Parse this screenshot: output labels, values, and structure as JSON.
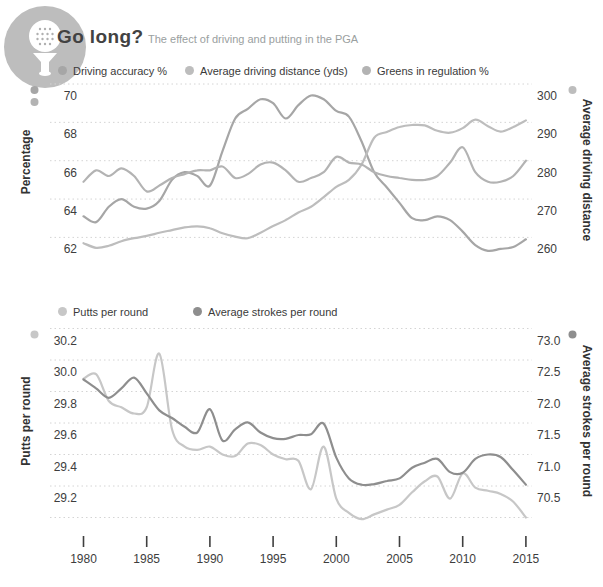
{
  "header": {
    "title": "Go long?",
    "subtitle": "The effect of driving and putting in the PGA",
    "icon": "golf-ball-on-tee"
  },
  "colors": {
    "grid": "#d4d4d4",
    "tick_text": "#3d3d3d",
    "axis_title_text": "#333333",
    "title_text": "#424242",
    "subtitle_text": "#9aa0a0",
    "icon_bg": "#bdbdbd",
    "legend_text": "#3a3a3a"
  },
  "chart_data": [
    {
      "type": "line",
      "x": [
        1980,
        1981,
        1982,
        1983,
        1984,
        1985,
        1986,
        1987,
        1988,
        1989,
        1990,
        1991,
        1992,
        1993,
        1994,
        1995,
        1996,
        1997,
        1998,
        1999,
        2000,
        2001,
        2002,
        2003,
        2004,
        2005,
        2006,
        2007,
        2008,
        2009,
        2010,
        2011,
        2012,
        2013,
        2014,
        2015
      ],
      "axes": {
        "left": {
          "title": "Percentage",
          "tick_labels": [
            "70",
            "68",
            "66",
            "64",
            "62"
          ],
          "range": [
            70,
            62
          ]
        },
        "right": {
          "title": "Average driving distance",
          "tick_labels": [
            "300",
            "290",
            "280",
            "270",
            "260"
          ],
          "range": [
            300,
            260
          ]
        },
        "x": {
          "tick_values": [
            1980,
            1985,
            1990,
            1995,
            2000,
            2005,
            2010,
            2015
          ],
          "labels_shown": false
        }
      },
      "grid": "dotted",
      "legend_position": "top",
      "series": [
        {
          "name": "Driving accuracy %",
          "axis": "left",
          "color": "#a6a6a6",
          "values": [
            63.1,
            62.8,
            63.6,
            64.0,
            63.6,
            63.5,
            63.9,
            65.0,
            65.4,
            65.2,
            64.7,
            66.5,
            68.2,
            68.7,
            69.2,
            69.0,
            68.2,
            68.9,
            69.4,
            69.2,
            68.6,
            68.3,
            67.0,
            65.4,
            64.6,
            63.8,
            63.0,
            62.9,
            63.1,
            62.9,
            62.3,
            61.6,
            61.3,
            61.4,
            61.5,
            61.9
          ]
        },
        {
          "name": "Average driving distance (yds)",
          "axis": "right",
          "color": "#bdbdbd",
          "values": [
            258.5,
            257.3,
            257.8,
            259.0,
            259.8,
            260.4,
            261.2,
            261.9,
            262.6,
            262.9,
            262.4,
            261.1,
            260.2,
            259.8,
            261.2,
            263.0,
            264.5,
            266.5,
            268.0,
            270.5,
            273.2,
            275.0,
            279.0,
            286.0,
            287.5,
            288.8,
            289.3,
            289.2,
            287.8,
            287.3,
            288.5,
            290.7,
            289.0,
            287.6,
            288.8,
            290.5
          ]
        },
        {
          "name": "Greens in regulation %",
          "axis": "left",
          "color": "#b3b3b3",
          "values": [
            64.9,
            65.5,
            65.2,
            65.6,
            65.2,
            64.4,
            64.7,
            65.1,
            65.3,
            65.5,
            65.5,
            65.7,
            65.1,
            65.3,
            65.8,
            65.9,
            65.5,
            64.9,
            65.1,
            65.4,
            66.2,
            65.9,
            65.8,
            65.4,
            65.2,
            65.1,
            65.0,
            65.0,
            65.2,
            65.9,
            66.7,
            65.4,
            64.9,
            64.9,
            65.2,
            66.0
          ]
        }
      ]
    },
    {
      "type": "line",
      "x": [
        1980,
        1981,
        1982,
        1983,
        1984,
        1985,
        1986,
        1987,
        1988,
        1989,
        1990,
        1991,
        1992,
        1993,
        1994,
        1995,
        1996,
        1997,
        1998,
        1999,
        2000,
        2001,
        2002,
        2003,
        2004,
        2005,
        2006,
        2007,
        2008,
        2009,
        2010,
        2011,
        2012,
        2013,
        2014,
        2015
      ],
      "axes": {
        "left": {
          "title": "Putts per round",
          "tick_labels": [
            "30.2",
            "30.0",
            "29.8",
            "29.6",
            "29.4",
            "29.2"
          ],
          "range": [
            30.2,
            29.0
          ]
        },
        "right": {
          "title": "Average strokes per round",
          "tick_labels": [
            "73.0",
            "72.5",
            "72.0",
            "71.5",
            "71.0",
            "70.5"
          ],
          "range": [
            73.0,
            70.0
          ]
        },
        "x": {
          "tick_values": [
            1980,
            1985,
            1990,
            1995,
            2000,
            2005,
            2010,
            2015
          ],
          "tick_labels": [
            "1980",
            "1985",
            "1990",
            "1995",
            "2000",
            "2005",
            "2010",
            "2015"
          ],
          "labels_shown": true
        }
      },
      "grid": "dotted",
      "legend_position": "top",
      "series": [
        {
          "name": "Putts per round",
          "axis": "left",
          "color": "#c7c7c7",
          "values": [
            29.88,
            29.91,
            29.74,
            29.7,
            29.66,
            29.7,
            30.04,
            29.56,
            29.45,
            29.43,
            29.45,
            29.4,
            29.39,
            29.47,
            29.46,
            29.4,
            29.37,
            29.36,
            29.18,
            29.45,
            29.12,
            29.03,
            28.99,
            29.02,
            29.05,
            29.08,
            29.16,
            29.23,
            29.26,
            29.12,
            29.28,
            29.19,
            29.17,
            29.15,
            29.1,
            29.0
          ]
        },
        {
          "name": "Average strokes per round",
          "axis": "right",
          "color": "#8e8e8e",
          "values": [
            72.19,
            72.05,
            71.9,
            72.05,
            72.22,
            71.97,
            71.7,
            71.58,
            71.44,
            71.35,
            71.72,
            71.22,
            71.4,
            71.51,
            71.35,
            71.26,
            71.25,
            71.31,
            71.32,
            71.49,
            70.95,
            70.62,
            70.52,
            70.53,
            70.58,
            70.62,
            70.79,
            70.87,
            70.93,
            70.72,
            70.71,
            70.93,
            71.0,
            70.96,
            70.75,
            70.52
          ]
        }
      ]
    }
  ]
}
